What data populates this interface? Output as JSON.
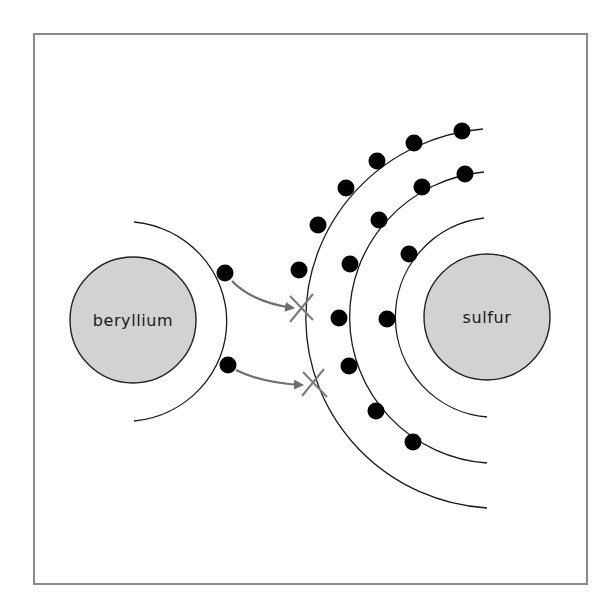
{
  "diagram": {
    "colors": {
      "nucleus_fill": "#d2d2d2",
      "electron": "#000000",
      "arrow": "#6e6e6e",
      "frame": "#8a8a8a"
    },
    "atoms": [
      {
        "label": "beryllium",
        "center": [
          133,
          320
        ],
        "nucleus_radius": 63,
        "shells": [
          {
            "radius": 103,
            "electrons": 2
          }
        ]
      },
      {
        "label": "sulfur",
        "center": [
          487,
          317
        ],
        "nucleus_radius": 63,
        "shells": [
          {
            "radius": 100,
            "electrons": 2
          },
          {
            "radius": 148,
            "electrons": 8
          },
          {
            "radius": 193,
            "electrons": 6,
            "vacancies": 2
          }
        ]
      }
    ],
    "transfers": [
      {
        "from": "beryllium electron 1",
        "to": "sulfur outer shell vacancy 1"
      },
      {
        "from": "beryllium electron 2",
        "to": "sulfur outer shell vacancy 2"
      }
    ]
  }
}
